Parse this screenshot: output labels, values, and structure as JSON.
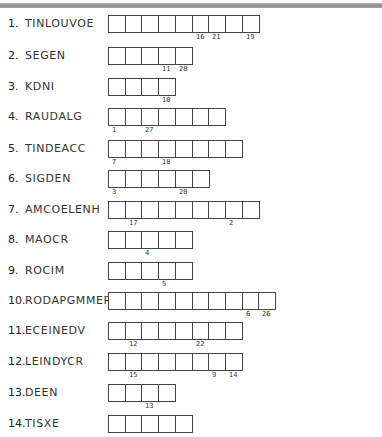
{
  "puzzle": {
    "rows": [
      {
        "number": "1.",
        "scrambled": "TINLOUVOE",
        "boxes": 9,
        "clues": [
          {
            "box": 6,
            "n": "16"
          },
          {
            "box": 7,
            "n": "21"
          },
          {
            "box": 9,
            "n": "19"
          }
        ]
      },
      {
        "number": "2.",
        "scrambled": "SEGEN",
        "boxes": 5,
        "clues": [
          {
            "box": 4,
            "n": "11"
          },
          {
            "box": 5,
            "n": "28"
          }
        ]
      },
      {
        "number": "3.",
        "scrambled": "KDNI",
        "boxes": 4,
        "clues": [
          {
            "box": 4,
            "n": "10"
          }
        ]
      },
      {
        "number": "4.",
        "scrambled": "RAUDALG",
        "boxes": 7,
        "clues": [
          {
            "box": 1,
            "n": "1"
          },
          {
            "box": 3,
            "n": "27"
          }
        ]
      },
      {
        "number": "5.",
        "scrambled": "TINDEACC",
        "boxes": 8,
        "clues": [
          {
            "box": 1,
            "n": "7"
          },
          {
            "box": 4,
            "n": "18"
          }
        ]
      },
      {
        "number": "6.",
        "scrambled": "SIGDEN",
        "boxes": 6,
        "clues": [
          {
            "box": 1,
            "n": "3"
          },
          {
            "box": 5,
            "n": "20"
          }
        ]
      },
      {
        "number": "7.",
        "scrambled": "AMCOELENH",
        "boxes": 9,
        "clues": [
          {
            "box": 2,
            "n": "17"
          },
          {
            "box": 8,
            "n": "2"
          }
        ]
      },
      {
        "number": "8.",
        "scrambled": "MAOCR",
        "boxes": 5,
        "clues": [
          {
            "box": 3,
            "n": "4"
          }
        ]
      },
      {
        "number": "9.",
        "scrambled": "ROCIM",
        "boxes": 5,
        "clues": [
          {
            "box": 4,
            "n": "5"
          }
        ]
      },
      {
        "number": "10.",
        "scrambled": "RODAPGMMER",
        "boxes": 10,
        "clues": [
          {
            "box": 9,
            "n": "6"
          },
          {
            "box": 10,
            "n": "26"
          }
        ]
      },
      {
        "number": "11.",
        "scrambled": "ECEINEDV",
        "boxes": 8,
        "clues": [
          {
            "box": 2,
            "n": "12"
          },
          {
            "box": 6,
            "n": "22"
          }
        ]
      },
      {
        "number": "12.",
        "scrambled": "LEINDYCR",
        "boxes": 8,
        "clues": [
          {
            "box": 2,
            "n": "15"
          },
          {
            "box": 7,
            "n": "9"
          },
          {
            "box": 8,
            "n": "14"
          }
        ]
      },
      {
        "number": "13.",
        "scrambled": "DEEN",
        "boxes": 4,
        "clues": [
          {
            "box": 3,
            "n": "13"
          }
        ]
      },
      {
        "number": "14.",
        "scrambled": "TISXE",
        "boxes": 5,
        "clues": []
      }
    ]
  }
}
